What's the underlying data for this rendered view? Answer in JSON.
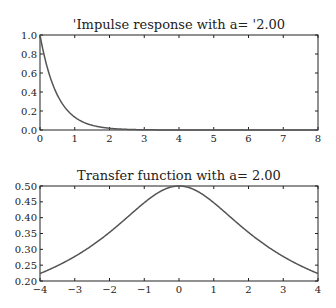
{
  "chart_data": [
    {
      "type": "line",
      "title": "'Impulse response with a= '2.00",
      "xlabel": "",
      "ylabel": "",
      "xlim": [
        0,
        8
      ],
      "ylim": [
        0.0,
        1.0
      ],
      "x_ticks": [
        "0",
        "1",
        "2",
        "3",
        "4",
        "5",
        "6",
        "7",
        "8"
      ],
      "y_ticks": [
        "0.0",
        "0.2",
        "0.4",
        "0.6",
        "0.8",
        "1.0"
      ],
      "grid": false,
      "series": [
        {
          "name": "exp(-2t)",
          "x": [
            0,
            0.25,
            0.5,
            0.75,
            1,
            1.5,
            2,
            2.5,
            3,
            4,
            5,
            6,
            7,
            8
          ],
          "values": [
            1.0,
            0.607,
            0.368,
            0.223,
            0.135,
            0.05,
            0.018,
            0.007,
            0.002,
            0.0,
            0.0,
            0.0,
            0.0,
            0.0
          ]
        }
      ]
    },
    {
      "type": "line",
      "title": "Transfer function with a= 2.00",
      "xlabel": "",
      "ylabel": "",
      "xlim": [
        -4,
        4
      ],
      "ylim": [
        0.2,
        0.5
      ],
      "x_ticks": [
        "−4",
        "−3",
        "−2",
        "−1",
        "0",
        "1",
        "2",
        "3",
        "4"
      ],
      "y_ticks": [
        "0.20",
        "0.25",
        "0.30",
        "0.35",
        "0.40",
        "0.45",
        "0.50"
      ],
      "grid": false,
      "series": [
        {
          "name": "1/sqrt(a^2+w^2)",
          "x": [
            -4,
            -3,
            -2,
            -1,
            0,
            1,
            2,
            3,
            4
          ],
          "values": [
            0.224,
            0.277,
            0.354,
            0.447,
            0.5,
            0.447,
            0.354,
            0.277,
            0.224
          ]
        }
      ]
    }
  ],
  "colors": {
    "line": "#555555",
    "axes": "#222222"
  }
}
